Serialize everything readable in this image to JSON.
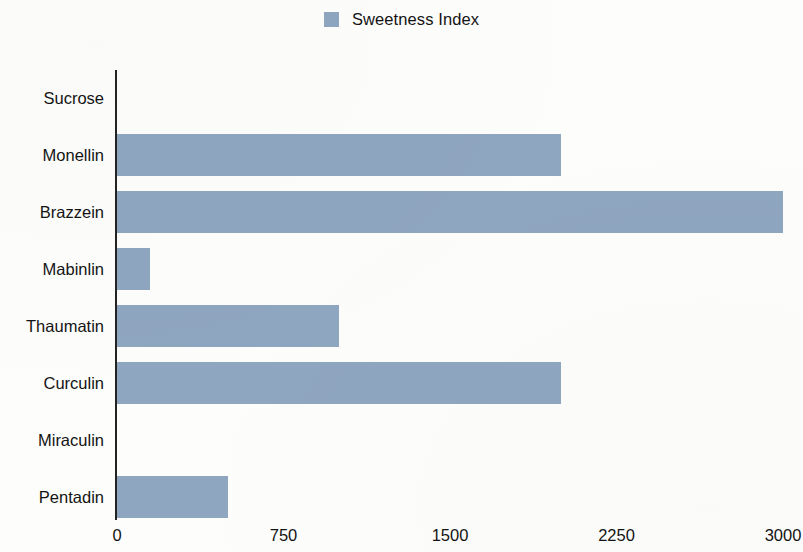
{
  "legend": {
    "position": "top-center",
    "entries": [
      {
        "label": "Sweetness Index",
        "color": "#8fa6c0"
      }
    ]
  },
  "axis": {
    "x_ticks": [
      "0",
      "750",
      "1500",
      "2250",
      "3000"
    ]
  },
  "chart_data": {
    "type": "bar",
    "orientation": "horizontal",
    "title": "",
    "subtitle": "",
    "xlabel": "",
    "ylabel": "",
    "xlim": [
      0,
      3000
    ],
    "xticks": [
      0,
      750,
      1500,
      2250,
      3000
    ],
    "grid": false,
    "legend_position": "top-center",
    "categories": [
      "Sucrose",
      "Monellin",
      "Brazzein",
      "Mabinlin",
      "Thaumatin",
      "Curculin",
      "Miraculin",
      "Pentadin"
    ],
    "series": [
      {
        "name": "Sweetness Index",
        "color": "#8fa6c0",
        "values": [
          1,
          2000,
          3000,
          150,
          1000,
          2000,
          1,
          500
        ]
      }
    ]
  }
}
